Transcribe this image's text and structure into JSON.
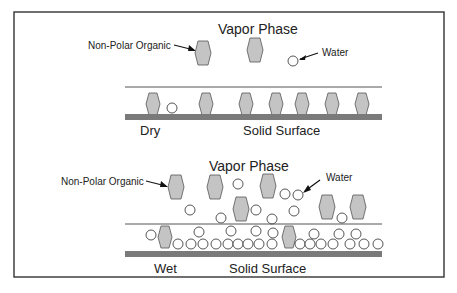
{
  "top_panel": {
    "title": "Vapor Phase",
    "organic_label": "Non-Polar Organic",
    "water_label": "Water",
    "condition": "Dry",
    "surface_label": "Solid Surface"
  },
  "bottom_panel": {
    "title": "Vapor Phase",
    "organic_label": "Non-Polar Organic",
    "water_label": "Water",
    "condition": "Wet",
    "surface_label": "Solid Surface"
  },
  "colors": {
    "organic_fill": "#bdbdbd",
    "organic_stroke": "#555555",
    "surface_fill": "#7a7a7a",
    "frame": "#333333"
  }
}
